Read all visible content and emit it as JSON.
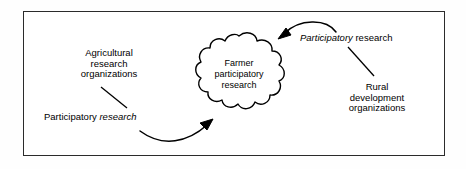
{
  "diagram": {
    "center_node": {
      "shape": "cloud",
      "lines": [
        "Farmer",
        "participatory",
        "research"
      ]
    },
    "left_actor": {
      "lines": [
        "Agricultural",
        "research",
        "organizations"
      ]
    },
    "left_link_label": {
      "plain": "Participatory",
      "italic": "research"
    },
    "right_link_label": {
      "italic": "Participatory",
      "plain": "research"
    },
    "right_actor": {
      "lines": [
        "Rural",
        "development",
        "organizations"
      ]
    },
    "arrows": [
      {
        "name": "arrow-left-to-cloud",
        "from": "Agricultural research organizations",
        "to": "Farmer participatory research",
        "direction": "up-right"
      },
      {
        "name": "arrow-right-to-cloud",
        "from": "Rural development organizations",
        "to": "Farmer participatory research",
        "direction": "down-left"
      }
    ],
    "colors": {
      "ink": "#000000",
      "frame": "#2b2b2b",
      "background": "#ffffff"
    }
  }
}
